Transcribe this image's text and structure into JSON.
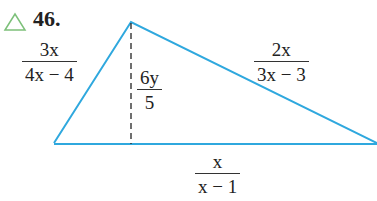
{
  "problem": {
    "number": "46.",
    "marker_icon": "triangle-outline",
    "marker_color": "#7dc07a"
  },
  "diagram": {
    "shape": "triangle",
    "line_color": "#2fa8de",
    "vertices": {
      "left": [
        54,
        143
      ],
      "apex": [
        131,
        22
      ],
      "right": [
        377,
        143
      ]
    },
    "altitude": {
      "from": [
        131,
        22
      ],
      "to": [
        131,
        143
      ],
      "style": "dashed"
    },
    "labels": {
      "left_side": {
        "numerator": "3x",
        "denominator": "4x − 4"
      },
      "height": {
        "numerator": "6y",
        "denominator": "5"
      },
      "right_side": {
        "numerator": "2x",
        "denominator": "3x − 3"
      },
      "base": {
        "numerator": "x",
        "denominator": "x − 1"
      }
    }
  }
}
